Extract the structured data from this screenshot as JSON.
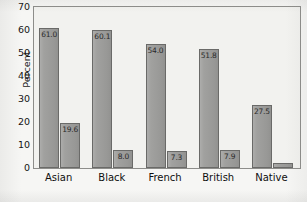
{
  "chart_data": {
    "type": "bar",
    "title": "",
    "xlabel": "",
    "ylabel": "Percent",
    "ylim": [
      0,
      70
    ],
    "yticks": [
      "0",
      "10",
      "20",
      "30",
      "40",
      "50",
      "60",
      "70"
    ],
    "grid": false,
    "legend": "none",
    "categories": [
      "Asian",
      "Black",
      "French",
      "British",
      "Native"
    ],
    "series": [
      {
        "name": "series-1",
        "values": [
          61.0,
          60.1,
          54.0,
          51.8,
          27.5
        ],
        "labels": [
          "61.0",
          "60.1",
          "54.0",
          "51.8",
          "27.5"
        ]
      },
      {
        "name": "series-2",
        "values": [
          19.6,
          8.0,
          7.3,
          7.9,
          2.3
        ],
        "labels": [
          "19.6",
          "8.0",
          "7.3",
          "7.9",
          ""
        ]
      }
    ],
    "colors": {
      "bar_fill": "#9d9d9b",
      "bar_stroke": "#6a6a68",
      "plot_background": "#f2f2ef",
      "frame": "#8d8d8a",
      "text": "#141414"
    }
  }
}
